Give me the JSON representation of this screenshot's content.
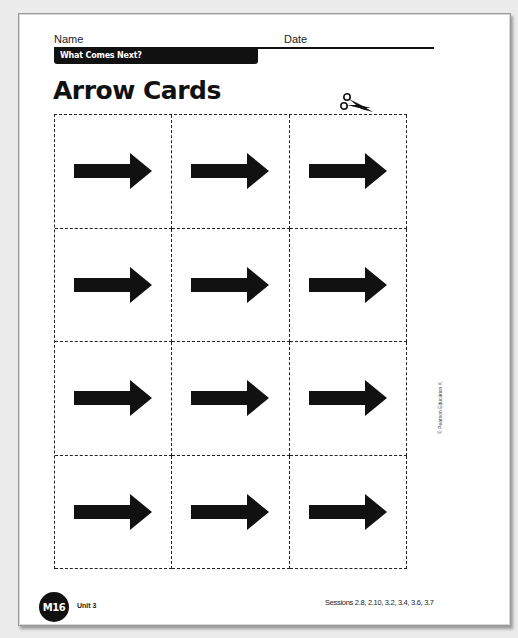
{
  "header": {
    "name_label": "Name",
    "date_label": "Date",
    "topic": "What Comes Next?"
  },
  "title": "Arrow Cards",
  "icons": {
    "cut_indicator": "scissors-icon",
    "card_symbol": "right-arrow-icon"
  },
  "grid": {
    "rows": 4,
    "columns": 3,
    "cards": [
      {
        "symbol": "right-arrow"
      },
      {
        "symbol": "right-arrow"
      },
      {
        "symbol": "right-arrow"
      },
      {
        "symbol": "right-arrow"
      },
      {
        "symbol": "right-arrow"
      },
      {
        "symbol": "right-arrow"
      },
      {
        "symbol": "right-arrow"
      },
      {
        "symbol": "right-arrow"
      },
      {
        "symbol": "right-arrow"
      },
      {
        "symbol": "right-arrow"
      },
      {
        "symbol": "right-arrow"
      },
      {
        "symbol": "right-arrow"
      }
    ]
  },
  "copyright": "© Pearson Education K",
  "footer": {
    "page_badge": "M16",
    "unit": "Unit 3",
    "sessions": "Sessions 2.8, 2.10, 3.2, 3.4, 3.6, 3.7"
  },
  "colors": {
    "ink": "#111111",
    "paper": "#ffffff",
    "background": "#ececec"
  }
}
